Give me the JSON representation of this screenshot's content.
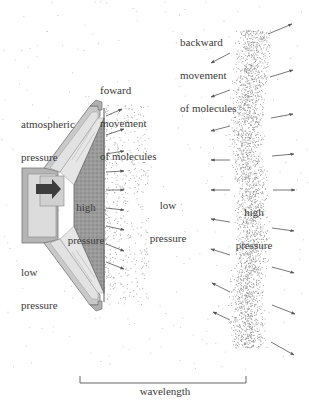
{
  "diagram": {
    "labels": {
      "forward": [
        "foward",
        "movement",
        "of molecules"
      ],
      "backward": [
        "backward",
        "movement",
        "of molecules"
      ],
      "atmospheric": [
        "atmospheric",
        "pressure"
      ],
      "speaker_high": [
        "high",
        "pressure"
      ],
      "speaker_low": [
        "low",
        "pressure"
      ],
      "middle_low": [
        "low",
        "pressure"
      ],
      "band_high": [
        "high",
        "pressure"
      ],
      "wavelength": "wavelength"
    },
    "colors": {
      "background": "#ffffff",
      "text": "#3a3a3a",
      "arrow": "#555555",
      "speaker_frame": "#9a9a9a",
      "speaker_light": "#d8d8d8",
      "cone_dark": "#8e8e8e",
      "piston_arrow": "#3c3c3c",
      "stipple": "#777777"
    },
    "components": [
      "loudspeaker",
      "compression-zone-near-speaker",
      "rarefaction-zone",
      "compression-band",
      "wavelength-bracket"
    ]
  }
}
